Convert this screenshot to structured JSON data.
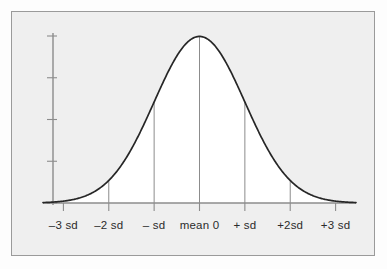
{
  "figure": {
    "name": "normal-distribution-bell-curve",
    "frame_border_color": "#9a9a9a",
    "plot_background_color": "#efefef",
    "curve_fill_color": "#ffffff",
    "curve_stroke_color": "#262626",
    "axis_color": "#8c8c8c",
    "dropline_color": "#8c8c8c"
  },
  "axes": {
    "y_axis": {
      "label": "",
      "tick_count": 5,
      "tick_labels": []
    },
    "x_axis": {
      "label": "",
      "tick_labels": [
        "–3 sd",
        "–2 sd",
        "– sd",
        "mean 0",
        "+ sd",
        "+2sd",
        "+3 sd"
      ]
    }
  },
  "chart_data": {
    "type": "line",
    "title": "",
    "subtitle": "",
    "xlabel": "",
    "ylabel": "",
    "grid": false,
    "legend": null,
    "distribution": "normal",
    "mean": 0,
    "sd": 1,
    "xlim": [
      -3.45,
      3.45
    ],
    "ylim": [
      0,
      0.4
    ],
    "x_tick_values": [
      -3,
      -2,
      -1,
      0,
      1,
      2,
      3
    ],
    "x_tick_labels": [
      "–3 sd",
      "–2 sd",
      "– sd",
      "mean 0",
      "+ sd",
      "+2sd",
      "+3 sd"
    ],
    "y_tick_values": [
      0,
      0.1,
      0.2,
      0.3,
      0.4
    ],
    "y_tick_labels": [],
    "droplines_at_x": [
      -2,
      -1,
      0,
      1,
      2
    ],
    "series": [
      {
        "name": "standard normal density",
        "x": [
          -3.45,
          -3.2,
          -3.0,
          -2.8,
          -2.6,
          -2.4,
          -2.2,
          -2.0,
          -1.8,
          -1.6,
          -1.4,
          -1.2,
          -1.0,
          -0.8,
          -0.6,
          -0.4,
          -0.2,
          0.0,
          0.2,
          0.4,
          0.6,
          0.8,
          1.0,
          1.2,
          1.4,
          1.6,
          1.8,
          2.0,
          2.2,
          2.4,
          2.6,
          2.8,
          3.0,
          3.2,
          3.45
        ],
        "values": [
          0.001,
          0.002,
          0.004,
          0.008,
          0.014,
          0.022,
          0.035,
          0.054,
          0.079,
          0.111,
          0.15,
          0.194,
          0.242,
          0.29,
          0.333,
          0.368,
          0.391,
          0.399,
          0.391,
          0.368,
          0.333,
          0.29,
          0.242,
          0.194,
          0.15,
          0.111,
          0.079,
          0.054,
          0.035,
          0.022,
          0.014,
          0.008,
          0.004,
          0.002,
          0.001
        ]
      }
    ]
  }
}
